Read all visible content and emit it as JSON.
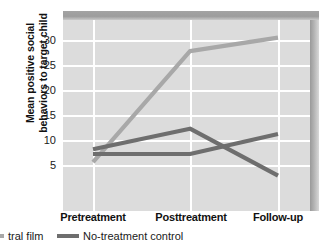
{
  "chart_data": {
    "type": "line",
    "title": "",
    "xlabel": "",
    "ylabel": "Mean positive social behaviors to target child",
    "ylabel_line1": "Mean positive social",
    "ylabel_line2": "behaviors to target child",
    "categories": [
      "Pretreatment",
      "Posttreatment",
      "Follow-up"
    ],
    "yticks": [
      5,
      10,
      15,
      20,
      25,
      30
    ],
    "ylim": [
      2.0,
      34.5
    ],
    "grid": true,
    "legend_position": "bottom-left",
    "series": [
      {
        "name": "tral film",
        "color": "#a8a8a8",
        "values": [
          10.3,
          29.2,
          31.5
        ],
        "in_legend": true,
        "truncated": true
      },
      {
        "name": "No-treatment control",
        "color": "#6e6e6e",
        "values": [
          11.7,
          11.7,
          15.1
        ],
        "in_legend": true,
        "truncated": false
      },
      {
        "name": "",
        "color": "#6e6e6e",
        "values": [
          12.5,
          16.0,
          8.0
        ],
        "in_legend": false,
        "truncated": false
      }
    ]
  },
  "axis": {
    "ytick_labels": [
      "30",
      "25",
      "20",
      "15",
      "10",
      "5"
    ],
    "xtick_labels": [
      "Pretreatment",
      "Posttreatment",
      "Follow-up"
    ]
  },
  "legend": {
    "items": [
      {
        "label": "tral film",
        "color": "#a8a8a8"
      },
      {
        "label": "No-treatment control",
        "color": "#6e6e6e"
      }
    ]
  },
  "colors": {
    "plot_background": "#dcdcdc",
    "gridline": "#ffffff",
    "bevel_top": "#9d9d9d",
    "bevel_right": "#b4b4b4",
    "series_light": "#a8a8a8",
    "series_dark": "#6e6e6e",
    "text": "#1a1a1a"
  }
}
